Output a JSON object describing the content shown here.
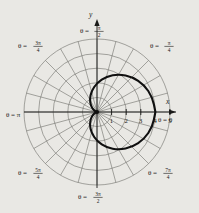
{
  "figure": {
    "background_color": "#e9e8e4",
    "ink_color": "#1a1a18",
    "grid_color": "#6f6e6a",
    "curve_color": "#101010",
    "axis_label_x": "x",
    "axis_label_y": "y"
  },
  "chart_data": {
    "type": "line",
    "plot_system": "polar",
    "title": "",
    "xlabel": "x",
    "ylabel": "y",
    "grid": true,
    "legend": "none",
    "origin_px": [
      97,
      112
    ],
    "pixels_per_unit": 14.6,
    "radial": {
      "ticks": [
        1,
        2,
        3,
        4,
        5
      ],
      "tick_labels": [
        "1",
        "2",
        "3",
        "4",
        "5"
      ],
      "rlim": [
        0,
        5
      ],
      "circle_count": 5
    },
    "angular": {
      "spoke_count": 24,
      "spoke_step_deg": 15,
      "labels": [
        {
          "id": "theta-0",
          "text": "θ = 0",
          "theta_deg": 0,
          "pi_fraction": "0"
        },
        {
          "id": "theta-pi-4",
          "text": "θ =",
          "theta_deg": 45,
          "numerator": "π",
          "denominator": "4"
        },
        {
          "id": "theta-pi-2",
          "text": "θ =",
          "theta_deg": 90,
          "numerator": "π",
          "denominator": "2"
        },
        {
          "id": "theta-3pi-4",
          "text": "θ =",
          "theta_deg": 135,
          "numerator": "3π",
          "denominator": "4"
        },
        {
          "id": "theta-pi",
          "text": "θ = π",
          "theta_deg": 180,
          "pi_fraction": "π"
        },
        {
          "id": "theta-5pi-4",
          "text": "θ =",
          "theta_deg": 225,
          "numerator": "5π",
          "denominator": "4"
        },
        {
          "id": "theta-3pi-2",
          "text": "θ =",
          "theta_deg": 270,
          "numerator": "3π",
          "denominator": "2"
        },
        {
          "id": "theta-7pi-4",
          "text": "θ =",
          "theta_deg": 315,
          "numerator": "7π",
          "denominator": "4"
        }
      ]
    },
    "series": [
      {
        "name": "cardioid",
        "equation": "r = 2(1 + cos θ)",
        "r_max": 4,
        "r_min": 0,
        "points_polar": [
          [
            0,
            4.0
          ],
          [
            15,
            3.93
          ],
          [
            30,
            3.73
          ],
          [
            45,
            3.41
          ],
          [
            60,
            3.0
          ],
          [
            75,
            2.52
          ],
          [
            90,
            2.0
          ],
          [
            105,
            1.48
          ],
          [
            120,
            1.0
          ],
          [
            135,
            0.59
          ],
          [
            150,
            0.27
          ],
          [
            165,
            0.07
          ],
          [
            180,
            0.0
          ],
          [
            195,
            0.07
          ],
          [
            210,
            0.27
          ],
          [
            225,
            0.59
          ],
          [
            240,
            1.0
          ],
          [
            255,
            1.48
          ],
          [
            270,
            2.0
          ],
          [
            285,
            2.52
          ],
          [
            300,
            3.0
          ],
          [
            315,
            3.41
          ],
          [
            330,
            3.73
          ],
          [
            345,
            3.93
          ],
          [
            360,
            4.0
          ]
        ]
      }
    ]
  }
}
